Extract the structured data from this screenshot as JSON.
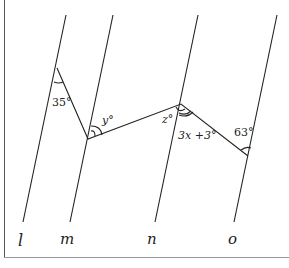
{
  "diagram": {
    "lines": [
      {
        "name": "l",
        "label": "l"
      },
      {
        "name": "m",
        "label": "m"
      },
      {
        "name": "n",
        "label": "n"
      },
      {
        "name": "o",
        "label": "o"
      }
    ],
    "angles": {
      "a": "35°",
      "y": "y°",
      "z": "z°",
      "expr": "3x +3°",
      "d": "63°"
    },
    "colors": {
      "stroke": "#222222"
    }
  }
}
